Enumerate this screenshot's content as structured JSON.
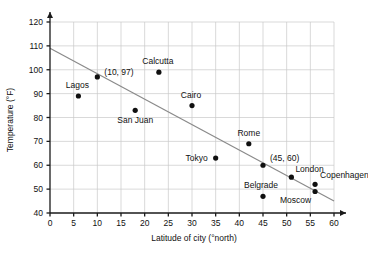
{
  "chart_data": {
    "type": "scatter",
    "title": "",
    "xlabel": "Latitude of city (°north)",
    "ylabel": "Temperature (°F)",
    "xlim": [
      0,
      60
    ],
    "ylim": [
      40,
      120
    ],
    "xticks": [
      0,
      5,
      10,
      15,
      20,
      25,
      30,
      35,
      40,
      45,
      50,
      55,
      60
    ],
    "yticks": [
      40,
      50,
      60,
      70,
      80,
      90,
      100,
      110,
      120
    ],
    "grid": true,
    "legend": "none",
    "points": [
      {
        "label": "Lagos",
        "x": 6,
        "y": 89,
        "label_dx": -1,
        "label_dy": -8,
        "anchor": "middle"
      },
      {
        "label": "",
        "x": 10,
        "y": 97,
        "label_dx": 0,
        "label_dy": 0,
        "anchor": "middle"
      },
      {
        "label": "San Juan",
        "x": 18,
        "y": 83,
        "label_dx": 0,
        "label_dy": 13,
        "anchor": "middle"
      },
      {
        "label": "Calcutta",
        "x": 23,
        "y": 99,
        "label_dx": -1,
        "label_dy": -8,
        "anchor": "middle"
      },
      {
        "label": "Cairo",
        "x": 30,
        "y": 85,
        "label_dx": -1,
        "label_dy": -8,
        "anchor": "middle"
      },
      {
        "label": "Tokyo",
        "x": 35,
        "y": 63,
        "label_dx": -8,
        "label_dy": 3,
        "anchor": "end"
      },
      {
        "label": "Rome",
        "x": 42,
        "y": 69,
        "label_dx": 0,
        "label_dy": -8,
        "anchor": "middle"
      },
      {
        "label": "",
        "x": 45,
        "y": 60,
        "label_dx": 0,
        "label_dy": 0,
        "anchor": "middle"
      },
      {
        "label": "Belgrade",
        "x": 45,
        "y": 47,
        "label_dx": -2,
        "label_dy": -8,
        "anchor": "middle"
      },
      {
        "label": "London",
        "x": 51,
        "y": 55,
        "label_dx": 4,
        "label_dy": -5,
        "anchor": "start"
      },
      {
        "label": "Copenhagen",
        "x": 56,
        "y": 52,
        "label_dx": 5,
        "label_dy": -6,
        "anchor": "start"
      },
      {
        "label": "Moscow",
        "x": 56,
        "y": 49,
        "label_dx": -4,
        "label_dy": 11,
        "anchor": "end"
      }
    ],
    "annotations": [
      {
        "text": "(10, 97)",
        "x": 10,
        "y": 97,
        "dx": 7,
        "dy": -2,
        "anchor": "start"
      },
      {
        "text": "(45, 60)",
        "x": 45,
        "y": 60,
        "dx": 7,
        "dy": -4,
        "anchor": "start"
      }
    ],
    "trend_line": {
      "x0": 0,
      "y0": 109,
      "x1": 60,
      "y1": 45,
      "color": "#8a8a8a"
    }
  },
  "colors": {
    "dot": "#101010",
    "grid": "#c9c9c9",
    "axis": "#1a1a1a",
    "trend": "#8a8a8a",
    "background": "#ffffff"
  }
}
